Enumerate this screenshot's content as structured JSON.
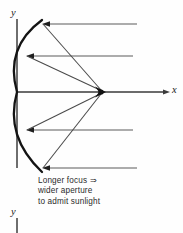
{
  "figure": {
    "kind": "parabolic-mirror-ray-diagram",
    "background_color": "#fefefe",
    "ink_color": "#1b1b1b",
    "ray_color": "#555555",
    "caption": {
      "lines": [
        "Longer focus ⇒",
        "wider aperture",
        "to admit sunlight"
      ],
      "line1": "Longer focus ⇒",
      "line2": "wider aperture",
      "line3": "to admit sunlight"
    },
    "axes": {
      "y_label_top": "y",
      "x_label_right": "x",
      "y_label_bottom": "y",
      "y_axis_x": 17,
      "x_axis_y": 92
    },
    "optics": {
      "vertex": {
        "x": 17,
        "y": 92
      },
      "focus": {
        "x": 103,
        "y": 92
      },
      "aperture_top": {
        "x": 42,
        "y": 20
      },
      "aperture_bottom": {
        "x": 42,
        "y": 172
      }
    },
    "incoming_rays": [
      {
        "name": "ray-top-outer",
        "y": 24,
        "x_start": 137,
        "x_end": 43
      },
      {
        "name": "ray-top-inner",
        "y": 56,
        "x_start": 133,
        "x_end": 26
      },
      {
        "name": "ray-axial",
        "y": 92,
        "x_start": 170,
        "x_end": 18
      },
      {
        "name": "ray-bottom-inner",
        "y": 130,
        "x_start": 133,
        "x_end": 26
      },
      {
        "name": "ray-bottom-outer",
        "y": 168,
        "x_start": 137,
        "x_end": 43
      }
    ],
    "reflected_rays": [
      {
        "name": "reflected-top-outer",
        "from_x": 43,
        "from_y": 24,
        "to_x": 103,
        "to_y": 92
      },
      {
        "name": "reflected-top-inner",
        "from_x": 26,
        "from_y": 56,
        "to_x": 103,
        "to_y": 92
      },
      {
        "name": "reflected-bottom-inner",
        "from_x": 26,
        "from_y": 130,
        "to_x": 103,
        "to_y": 92
      },
      {
        "name": "reflected-bottom-outer",
        "from_x": 43,
        "from_y": 168,
        "to_x": 103,
        "to_y": 92
      }
    ]
  }
}
